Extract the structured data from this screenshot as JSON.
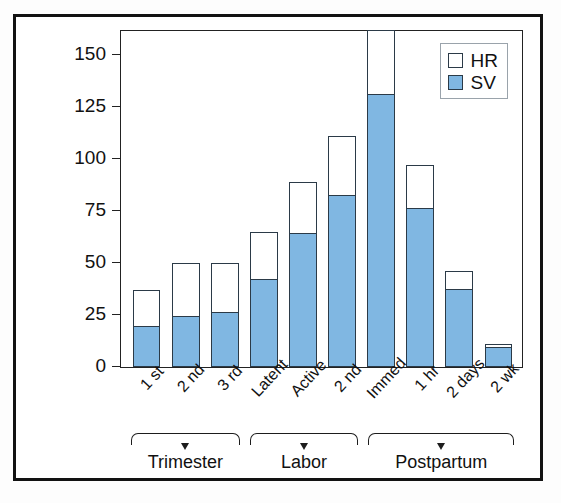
{
  "chart_data": {
    "type": "bar",
    "title": "",
    "subtitle": "",
    "xlabel": "",
    "ylabel": "Cardiac output (% change from prepregnant)",
    "ylabel_line1": "Cardiac output",
    "ylabel_line2": "(% change from prepregnant)",
    "ylim": [
      0,
      162
    ],
    "yticks": [
      0,
      25,
      50,
      75,
      100,
      125,
      150
    ],
    "ytick_labels": [
      "0",
      "25",
      "50",
      "75",
      "100",
      "125",
      "150"
    ],
    "grid": false,
    "stacked": true,
    "legend_position": "top-right",
    "categories": [
      "1 st",
      "2 nd",
      "3 rd",
      "Latent",
      "Active",
      "2 nd",
      "Immed",
      "1 hr",
      "2 days",
      "2 wk"
    ],
    "groups": [
      {
        "label": "Trimester",
        "span": 3
      },
      {
        "label": "Labor",
        "span": 3
      },
      {
        "label": "Postpartum",
        "span": 4
      }
    ],
    "series": [
      {
        "name": "SV",
        "color": "#80b7e2",
        "values": [
          19,
          24,
          26,
          42,
          64,
          82,
          131,
          76,
          37,
          9
        ]
      },
      {
        "name": "HR",
        "color": "#ffffff",
        "values": [
          18,
          26,
          24,
          23,
          25,
          29,
          31,
          21,
          9,
          2
        ]
      }
    ],
    "totals": [
      37,
      50,
      50,
      65,
      89,
      111,
      162,
      97,
      46,
      11
    ],
    "legend": [
      {
        "label": "HR",
        "swatch": "white"
      },
      {
        "label": "SV",
        "swatch": "blue"
      }
    ]
  },
  "colors": {
    "sv_blue": "#80b7e2",
    "bar_outline": "#2b3a47",
    "axis": "#222222",
    "frame": "#121212",
    "legend_border": "#9aa3ab",
    "background": "#ffffff"
  }
}
